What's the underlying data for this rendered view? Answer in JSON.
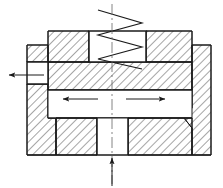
{
  "drawing": {
    "title": "Valve cross-section schematic",
    "type": "engineering-cross-section",
    "canvas": {
      "width": 223,
      "height": 188
    },
    "style": {
      "line_color": "#1a1a1a",
      "hatch_color": "#2b2b2b",
      "fill_void": "#ffffff",
      "centerline_color": "#555555",
      "line_width": 1.0,
      "hatch_spacing": 4.2,
      "hatch_angle_deg": 45
    },
    "labels": {
      "left_port": "",
      "right_port": "",
      "bottom_inlet": "",
      "spring": "",
      "note": ""
    },
    "parts": [
      {
        "name": "body-upper-left-block",
        "kind": "hatched-solid"
      },
      {
        "name": "body-upper-right-block",
        "kind": "hatched-solid"
      },
      {
        "name": "spring-chamber",
        "kind": "void"
      },
      {
        "name": "spring",
        "kind": "zigzag"
      },
      {
        "name": "left-flange",
        "kind": "hatched-solid"
      },
      {
        "name": "right-flange",
        "kind": "hatched-solid"
      },
      {
        "name": "left-port-void",
        "kind": "void"
      },
      {
        "name": "flow-passage",
        "kind": "void"
      },
      {
        "name": "body-lower-left-block",
        "kind": "hatched-solid"
      },
      {
        "name": "body-lower-right-block",
        "kind": "hatched-solid"
      },
      {
        "name": "inlet-bore",
        "kind": "void"
      }
    ],
    "flow_arrows": [
      {
        "name": "flow-arrow-left",
        "direction": "left",
        "x1": 98,
        "y1": 99,
        "x2": 62,
        "y2": 99
      },
      {
        "name": "flow-arrow-right",
        "direction": "right",
        "x1": 126,
        "y1": 99,
        "x2": 166,
        "y2": 99
      },
      {
        "name": "outlet-arrow-left",
        "direction": "left",
        "x1": 42,
        "y1": 75,
        "x2": 8,
        "y2": 75
      },
      {
        "name": "inlet-arrow-bottom",
        "direction": "up",
        "x1": 112,
        "y1": 186,
        "x2": 112,
        "y2": 157
      }
    ],
    "centerline": {
      "name": "vertical-centerline",
      "x": 112,
      "y1": 4,
      "y2": 184
    }
  }
}
